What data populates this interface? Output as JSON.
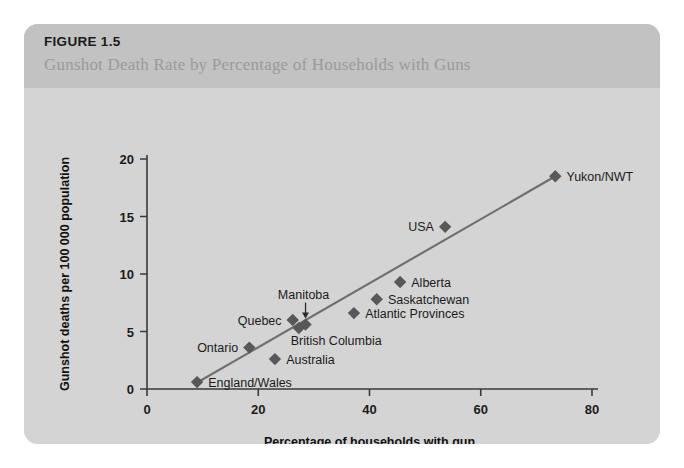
{
  "figure": {
    "number": "FIGURE 1.5",
    "title": "Gunshot Death Rate by Percentage of Households with Guns"
  },
  "colors": {
    "panel_background": "#d2d2d2",
    "header_background": "#c2c2c2",
    "plot_background": "#d4d4d4",
    "marker": "#585858",
    "trend_line": "#6e6e6e",
    "axis": "#3a3a3a",
    "figure_number_text": "#1a1a1a",
    "title_text": "#9a9a9a"
  },
  "chart_data": {
    "type": "scatter",
    "title": "Gunshot Death Rate by Percentage of Households with Guns",
    "xlabel": "Percentage of households with gun",
    "ylabel": "Gunshot deaths per 100 000 population",
    "xlim": [
      0,
      80
    ],
    "ylim": [
      0,
      20
    ],
    "xticks": [
      0,
      20,
      40,
      60,
      80
    ],
    "yticks": [
      0,
      5,
      10,
      15,
      20
    ],
    "xtick_labels": [
      "0",
      "20",
      "40",
      "60",
      "80"
    ],
    "ytick_labels": [
      "0",
      "5",
      "10",
      "15",
      "20"
    ],
    "grid": false,
    "legend": false,
    "points": [
      {
        "label": "England/Wales",
        "x": 9,
        "y": 0.6,
        "label_pos": "right"
      },
      {
        "label": "Australia",
        "x": 23,
        "y": 2.6,
        "label_pos": "right"
      },
      {
        "label": "Ontario",
        "x": 18.4,
        "y": 3.6,
        "label_pos": "left"
      },
      {
        "label": "Quebec",
        "x": 26.2,
        "y": 6.0,
        "label_pos": "left"
      },
      {
        "label": "British Columbia",
        "x": 27.3,
        "y": 5.3,
        "label_pos": "below"
      },
      {
        "label": "Manitoba",
        "x": 28.5,
        "y": 5.6,
        "label_pos": "above"
      },
      {
        "label": "Atlantic Provinces",
        "x": 37.2,
        "y": 6.6,
        "label_pos": "right"
      },
      {
        "label": "Saskatchewan",
        "x": 41.3,
        "y": 7.8,
        "label_pos": "right"
      },
      {
        "label": "Alberta",
        "x": 45.5,
        "y": 9.3,
        "label_pos": "right"
      },
      {
        "label": "USA",
        "x": 53.6,
        "y": 14.1,
        "label_pos": "left"
      },
      {
        "label": "Yukon/NWT",
        "x": 73.4,
        "y": 18.5,
        "label_pos": "right"
      }
    ],
    "trend_line": {
      "x0": 8.8,
      "y0": 0.5,
      "x1": 73.4,
      "y1": 18.5
    }
  }
}
